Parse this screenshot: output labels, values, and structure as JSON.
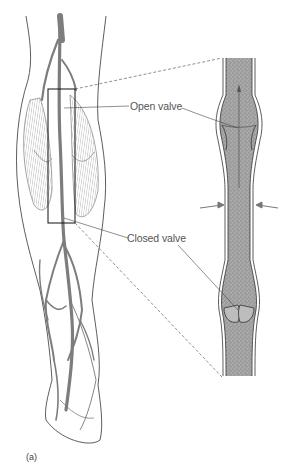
{
  "figure": {
    "panel_label": "(a)",
    "labels": {
      "open_valve": "Open valve",
      "closed_valve": "Closed valve"
    },
    "colors": {
      "vein_fill": "#9a9a9a",
      "blood_stipple": "#8c8c8c",
      "line": "#333333",
      "label_text": "#555555",
      "muscle_hatch": "#777777"
    }
  }
}
